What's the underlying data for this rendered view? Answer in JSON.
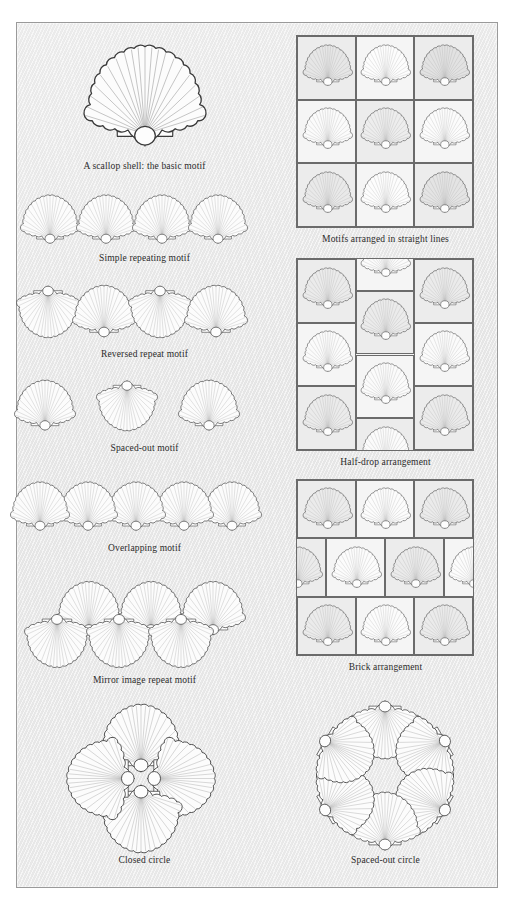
{
  "plate": {
    "title": "Scallop shell motif arrangement plate",
    "background_color": "#eaeaea",
    "border_color": "#9a9a9a",
    "shell_outline_color": "#3a3a3a",
    "shell_fill_color": "#fbfbfb",
    "shell_rib_color": "#8d8d8d"
  },
  "left_column": [
    {
      "id": "basic-motif",
      "caption": "A scallop shell: the basic motif",
      "shell_count": 1,
      "arrangement": "single"
    },
    {
      "id": "simple-repeating",
      "caption": "Simple repeating motif",
      "shell_count": 4,
      "arrangement": "row-upright"
    },
    {
      "id": "reversed-repeat",
      "caption": "Reversed repeat motif",
      "shell_count": 4,
      "arrangement": "row-alternating-180"
    },
    {
      "id": "spaced-out",
      "caption": "Spaced-out motif",
      "shell_count": 3,
      "arrangement": "row-spaced-alternating"
    },
    {
      "id": "overlapping",
      "caption": "Overlapping motif",
      "shell_count": 5,
      "arrangement": "row-overlapping"
    },
    {
      "id": "mirror-image",
      "caption": "Mirror image repeat motif",
      "shell_count": 6,
      "arrangement": "two-rows-mirrored"
    },
    {
      "id": "closed-circle",
      "caption": "Closed circle",
      "shell_count": 4,
      "arrangement": "radial-4"
    }
  ],
  "right_column": [
    {
      "id": "straight-lines",
      "caption": "Motifs arranged in straight lines",
      "grid": {
        "rows": 3,
        "cols": 3
      },
      "shell_count": 9,
      "arrangement": "grid"
    },
    {
      "id": "half-drop",
      "caption": "Half-drop arrangement",
      "grid": {
        "rows": 3,
        "cols": 3
      },
      "shell_count": 11,
      "arrangement": "half-drop-vertical"
    },
    {
      "id": "brick",
      "caption": "Brick arrangement",
      "grid": {
        "rows": 3,
        "cols": 3
      },
      "shell_count": 11,
      "arrangement": "brick-horizontal"
    },
    {
      "id": "spaced-out-circle",
      "caption": "Spaced-out circle",
      "shell_count": 6,
      "arrangement": "radial-6"
    }
  ]
}
